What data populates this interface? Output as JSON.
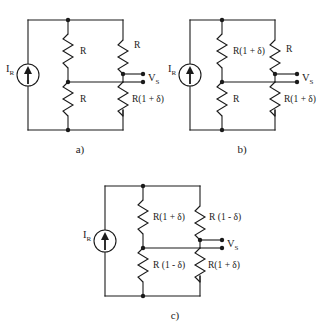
{
  "figure": {
    "ink_color": "#1a1a1a",
    "background_color": "#ffffff"
  },
  "symbols": {
    "current_source_name": "current-source-icon",
    "resistor_name": "resistor-icon",
    "node_name": "junction-node",
    "terminal_name": "output-terminal"
  },
  "circuits": [
    {
      "id": "a",
      "caption": "a)",
      "source_label_main": "I",
      "source_label_sub": "R",
      "output_label_main": "V",
      "output_label_sub": "S",
      "resistors": {
        "top_middle": "R",
        "bottom_middle": "R",
        "top_right": "R",
        "bottom_right": "R(1 + δ)"
      }
    },
    {
      "id": "b",
      "caption": "b)",
      "source_label_main": "I",
      "source_label_sub": "R",
      "output_label_main": "V",
      "output_label_sub": "S",
      "resistors": {
        "top_middle": "R(1 + δ)",
        "bottom_middle": "R",
        "top_right": "R",
        "bottom_right": "R(1 + δ)"
      }
    },
    {
      "id": "c",
      "caption": "c)",
      "source_label_main": "I",
      "source_label_sub": "R",
      "output_label_main": "V",
      "output_label_sub": "S",
      "resistors": {
        "top_middle": "R(1 + δ)",
        "bottom_middle": "R (1 - δ)",
        "top_right": "R (1 - δ)",
        "bottom_right": "R(1 + δ)"
      }
    }
  ]
}
